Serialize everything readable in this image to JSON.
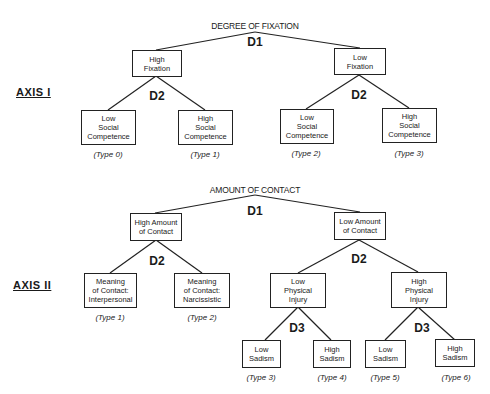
{
  "axis1": {
    "label": "AXIS I",
    "title": "DEGREE OF FIXATION",
    "d1": "D1",
    "d2_left": "D2",
    "d2_right": "D2",
    "nodes": {
      "high_fixation": [
        "High",
        "Fixation"
      ],
      "low_fixation": [
        "Low",
        "Fixation"
      ],
      "leaf0": [
        "Low",
        "Social",
        "Competence"
      ],
      "leaf1": [
        "High",
        "Social",
        "Competence"
      ],
      "leaf2": [
        "Low",
        "Social",
        "Competence"
      ],
      "leaf3": [
        "High",
        "Social",
        "Competence"
      ]
    },
    "types": [
      "(Type 0)",
      "(Type 1)",
      "(Type 2)",
      "(Type 3)"
    ]
  },
  "axis2": {
    "label": "AXIS II",
    "title": "AMOUNT OF CONTACT",
    "d1": "D1",
    "d2_left": "D2",
    "d2_right": "D2",
    "d3_left": "D3",
    "d3_right": "D3",
    "nodes": {
      "high_amount": [
        "High Amount",
        "of Contact"
      ],
      "low_amount": [
        "Low Amount",
        "of Contact"
      ],
      "interpersonal": [
        "Meaning",
        "of Contact:",
        "Interpersonal"
      ],
      "narcissistic": [
        "Meaning",
        "of Contact:",
        "Narcissistic"
      ],
      "low_injury": [
        "Low",
        "Physical",
        "Injury"
      ],
      "high_injury": [
        "High",
        "Physical",
        "Injury"
      ],
      "leaf3": [
        "Low",
        "Sadism"
      ],
      "leaf4": [
        "High",
        "Sadism"
      ],
      "leaf5": [
        "Low",
        "Sadism"
      ],
      "leaf6": [
        "High",
        "Sadism"
      ]
    },
    "types": [
      "(Type 1)",
      "(Type 2)",
      "(Type 3)",
      "(Type 4)",
      "(Type 5)",
      "(Type 6)"
    ]
  }
}
